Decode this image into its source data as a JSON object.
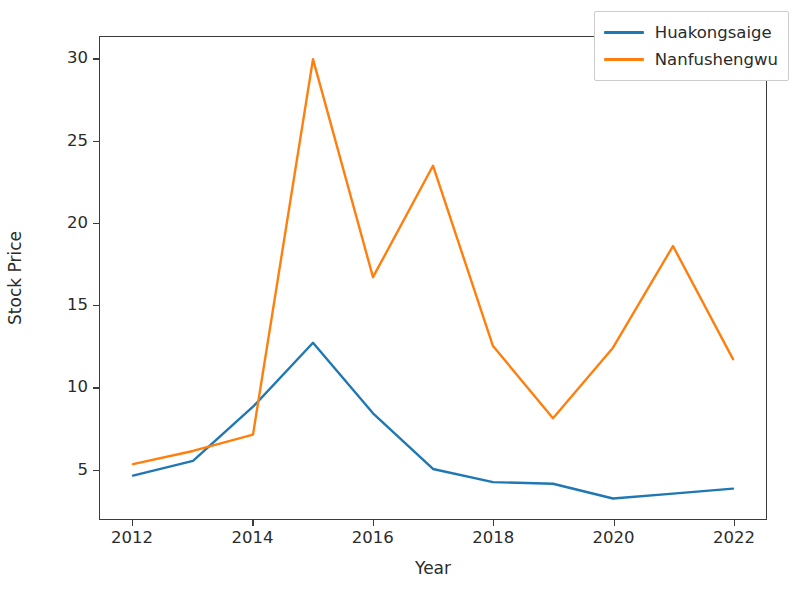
{
  "chart_data": {
    "type": "line",
    "title": "",
    "xlabel": "Year",
    "ylabel": "Stock Price",
    "x": [
      2012,
      2013,
      2014,
      2015,
      2016,
      2017,
      2018,
      2019,
      2020,
      2021,
      2022
    ],
    "xtick_labels": [
      "2012",
      "2014",
      "2016",
      "2018",
      "2020",
      "2022"
    ],
    "xticks": [
      2012,
      2014,
      2016,
      2018,
      2020,
      2022
    ],
    "ytick_labels": [
      "5",
      "10",
      "15",
      "20",
      "25",
      "30"
    ],
    "yticks": [
      5,
      10,
      15,
      20,
      25,
      30
    ],
    "xlim": [
      2011.45,
      2022.55
    ],
    "ylim": [
      1.95,
      31.35
    ],
    "grid": false,
    "legend_position": "upper right",
    "series": [
      {
        "name": "Huakongsaige",
        "color": "#1f77b4",
        "values": [
          4.6,
          5.5,
          8.8,
          12.7,
          8.4,
          5.0,
          4.2,
          4.1,
          3.2,
          3.5,
          3.8
        ]
      },
      {
        "name": "Nanfushengwu",
        "color": "#ff7f0e",
        "values": [
          5.3,
          6.1,
          7.1,
          30.0,
          16.7,
          23.5,
          12.5,
          8.1,
          12.4,
          18.6,
          11.7
        ]
      }
    ]
  }
}
